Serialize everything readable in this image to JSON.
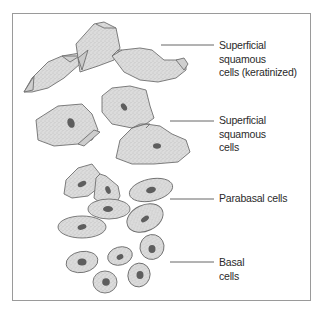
{
  "diagram": {
    "style": {
      "cell_fill": "#d9d9d9",
      "cell_stroke": "#6f6f6f",
      "nucleus_fill": "#5e5e5e",
      "frame_color": "#9a9a9a",
      "leader_color": "#555555"
    },
    "labels": [
      {
        "id": "keratinized",
        "lines": [
          "Superficial",
          "squamous",
          "cells (keratinized)"
        ]
      },
      {
        "id": "superficial",
        "lines": [
          "Superficial",
          "squamous",
          "cells"
        ]
      },
      {
        "id": "parabasal",
        "lines": [
          "Parabasal cells"
        ]
      },
      {
        "id": "basal",
        "lines": [
          "Basal",
          "cells"
        ]
      }
    ]
  }
}
